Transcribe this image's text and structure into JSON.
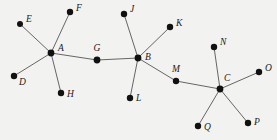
{
  "figure": {
    "kind": "undirected-tree-graph",
    "background_color": "#f2f2f0",
    "edge_color": "#555555",
    "node_color": "#111111",
    "label_color": "#1a1a1a",
    "width": 277,
    "height": 140
  },
  "graph": {
    "nodes": [
      {
        "id": "E",
        "label": "E",
        "x": 20,
        "y": 24,
        "r": 3.0,
        "label_x": 26,
        "label_y": 22,
        "anchor": "start"
      },
      {
        "id": "F",
        "label": "F",
        "x": 70,
        "y": 12,
        "r": 3.2,
        "label_x": 76,
        "label_y": 11,
        "anchor": "start"
      },
      {
        "id": "A",
        "label": "A",
        "x": 51,
        "y": 53,
        "r": 3.4,
        "label_x": 58,
        "label_y": 51,
        "anchor": "start"
      },
      {
        "id": "D",
        "label": "D",
        "x": 14,
        "y": 76,
        "r": 3.2,
        "label_x": 19,
        "label_y": 85,
        "anchor": "start"
      },
      {
        "id": "H",
        "label": "H",
        "x": 61,
        "y": 93,
        "r": 3.2,
        "label_x": 67,
        "label_y": 97,
        "anchor": "start"
      },
      {
        "id": "G",
        "label": "G",
        "x": 97,
        "y": 60,
        "r": 3.4,
        "label_x": 97,
        "label_y": 51,
        "anchor": "middle"
      },
      {
        "id": "J",
        "label": "J",
        "x": 124,
        "y": 14,
        "r": 3.2,
        "label_x": 130,
        "label_y": 12,
        "anchor": "start"
      },
      {
        "id": "K",
        "label": "K",
        "x": 170,
        "y": 27,
        "r": 3.2,
        "label_x": 176,
        "label_y": 26,
        "anchor": "start"
      },
      {
        "id": "B",
        "label": "B",
        "x": 138,
        "y": 58,
        "r": 3.4,
        "label_x": 145,
        "label_y": 60,
        "anchor": "start"
      },
      {
        "id": "L",
        "label": "L",
        "x": 130,
        "y": 98,
        "r": 3.2,
        "label_x": 136,
        "label_y": 101,
        "anchor": "start"
      },
      {
        "id": "M",
        "label": "M",
        "x": 176,
        "y": 81,
        "r": 3.2,
        "label_x": 176,
        "label_y": 72,
        "anchor": "middle"
      },
      {
        "id": "N",
        "label": "N",
        "x": 214,
        "y": 47,
        "r": 3.2,
        "label_x": 220,
        "label_y": 45,
        "anchor": "start"
      },
      {
        "id": "C",
        "label": "C",
        "x": 220,
        "y": 89,
        "r": 3.4,
        "label_x": 224,
        "label_y": 81,
        "anchor": "start"
      },
      {
        "id": "O",
        "label": "O",
        "x": 259,
        "y": 72,
        "r": 3.2,
        "label_x": 265,
        "label_y": 71,
        "anchor": "start"
      },
      {
        "id": "Q",
        "label": "Q",
        "x": 198,
        "y": 126,
        "r": 3.2,
        "label_x": 204,
        "label_y": 130,
        "anchor": "start"
      },
      {
        "id": "P",
        "label": "P",
        "x": 248,
        "y": 123,
        "r": 3.2,
        "label_x": 254,
        "label_y": 125,
        "anchor": "start"
      }
    ],
    "edges": [
      {
        "from": "A",
        "to": "E"
      },
      {
        "from": "A",
        "to": "F"
      },
      {
        "from": "A",
        "to": "D"
      },
      {
        "from": "A",
        "to": "H"
      },
      {
        "from": "A",
        "to": "G"
      },
      {
        "from": "G",
        "to": "B"
      },
      {
        "from": "B",
        "to": "J"
      },
      {
        "from": "B",
        "to": "K"
      },
      {
        "from": "B",
        "to": "L"
      },
      {
        "from": "B",
        "to": "M"
      },
      {
        "from": "M",
        "to": "C"
      },
      {
        "from": "C",
        "to": "N"
      },
      {
        "from": "C",
        "to": "O"
      },
      {
        "from": "C",
        "to": "Q"
      },
      {
        "from": "C",
        "to": "P"
      }
    ]
  }
}
